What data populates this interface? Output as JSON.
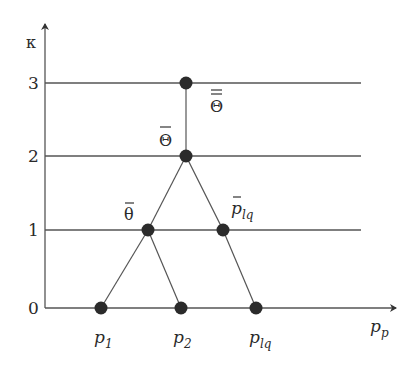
{
  "diagram": {
    "y_axis": {
      "label": "κ",
      "ticks": [
        "0",
        "1",
        "2",
        "3"
      ]
    },
    "x_axis": {
      "label_main": "p",
      "label_sub": "p"
    },
    "levels": [
      {
        "value": "3",
        "y": 83
      },
      {
        "value": "2",
        "y": 156
      },
      {
        "value": "1",
        "y": 230
      },
      {
        "value": "0",
        "y": 308
      }
    ],
    "nodes": [
      {
        "id": "p1",
        "label_main": "p",
        "label_sub": "1",
        "level": 0
      },
      {
        "id": "p2",
        "label_main": "p",
        "label_sub": "2",
        "level": 0
      },
      {
        "id": "plq",
        "label_main": "p",
        "label_sub": "lq",
        "level": 0
      },
      {
        "id": "theta_bar",
        "label": "θ",
        "overline": "single",
        "level": 1
      },
      {
        "id": "plq_bar",
        "label_main": "p",
        "label_sub": "lq",
        "overline": "single",
        "level": 1
      },
      {
        "id": "Theta_bar",
        "label": "Θ",
        "overline": "single",
        "level": 2
      },
      {
        "id": "Theta_dbar",
        "label": "Θ",
        "overline": "double",
        "level": 3
      }
    ],
    "edges": [
      [
        "p1",
        "theta_bar"
      ],
      [
        "p2",
        "theta_bar"
      ],
      [
        "plq",
        "plq_bar"
      ],
      [
        "theta_bar",
        "Theta_bar"
      ],
      [
        "plq_bar",
        "Theta_bar"
      ],
      [
        "Theta_bar",
        "Theta_dbar"
      ]
    ],
    "colors": {
      "line": "#555555",
      "node": "#2b2b2b",
      "text": "#2a2a2a"
    }
  }
}
